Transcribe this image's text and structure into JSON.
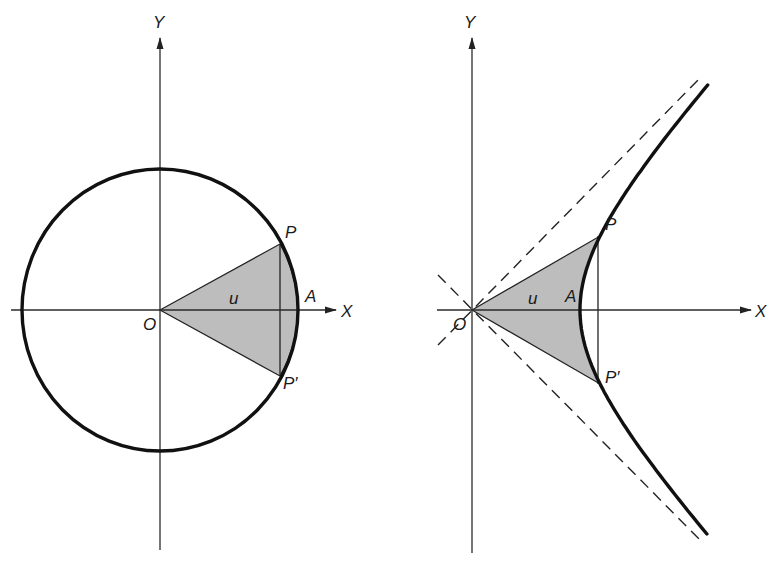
{
  "figure": {
    "shade_color": "#bdbdbd",
    "line_color": "#111111",
    "background": "#ffffff"
  },
  "left_panel": {
    "title": "Unit circle with circular sector",
    "labels": {
      "y_axis": "Y",
      "x_axis": "X",
      "origin": "O",
      "point_p": "P",
      "point_p_prime": "P′",
      "point_a": "A",
      "parameter": "u"
    },
    "geometry": {
      "origin": [
        160,
        310
      ],
      "circle_rx": 138,
      "circle_ry": 141,
      "p": [
        280,
        244
      ],
      "p_prime": [
        280,
        376
      ],
      "a": [
        298,
        310
      ]
    }
  },
  "right_panel": {
    "title": "Unit hyperbola with hyperbolic sector",
    "labels": {
      "y_axis": "Y",
      "x_axis": "X",
      "origin": "O",
      "point_p": "P",
      "point_p_prime": "P′",
      "point_a": "A",
      "parameter": "u"
    },
    "geometry": {
      "origin": [
        472,
        310
      ],
      "hyperbola_a": 108,
      "hyperbola_b": 116,
      "p": [
        598,
        236
      ],
      "p_prime": [
        598,
        384
      ],
      "a": [
        580,
        310
      ],
      "asymptotes": "dashed lines y = ±x"
    }
  }
}
